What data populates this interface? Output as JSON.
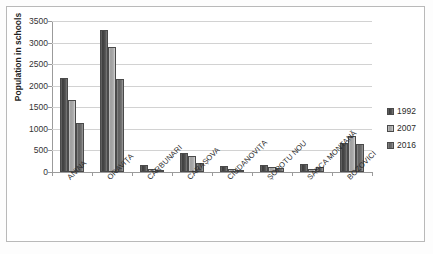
{
  "chart_data": {
    "type": "bar",
    "title": "",
    "xlabel": "",
    "ylabel": "Population in schools",
    "ylim": [
      0,
      3500
    ],
    "yticks": [
      0,
      500,
      1000,
      1500,
      2000,
      2500,
      3000,
      3500
    ],
    "ytick_labels": [
      "0",
      "500",
      "1000",
      "1500",
      "2000",
      "2500",
      "3000",
      "3500"
    ],
    "grid": true,
    "legend_position": "right",
    "categories": [
      "ANINA",
      "ORAVIȚA",
      "CĂRBUNARI",
      "CARAȘOVA",
      "CIUDANOVIȚA",
      "ȘOPOTU NOU",
      "SASCA MONTANĂ",
      "BOZOVICI"
    ],
    "series": [
      {
        "name": "1992",
        "color": "#4a4a4a",
        "values": [
          2180,
          3290,
          160,
          440,
          150,
          170,
          180,
          665
        ]
      },
      {
        "name": "2007",
        "color": "#aaaaaa",
        "values": [
          1660,
          2900,
          75,
          375,
          80,
          105,
          80,
          830
        ]
      },
      {
        "name": "2016",
        "color": "#6e6e6e",
        "values": [
          1130,
          2160,
          40,
          200,
          35,
          100,
          120,
          640
        ]
      }
    ]
  },
  "legend": {
    "items": [
      {
        "label": "1992"
      },
      {
        "label": "2007"
      },
      {
        "label": "2016"
      }
    ]
  }
}
